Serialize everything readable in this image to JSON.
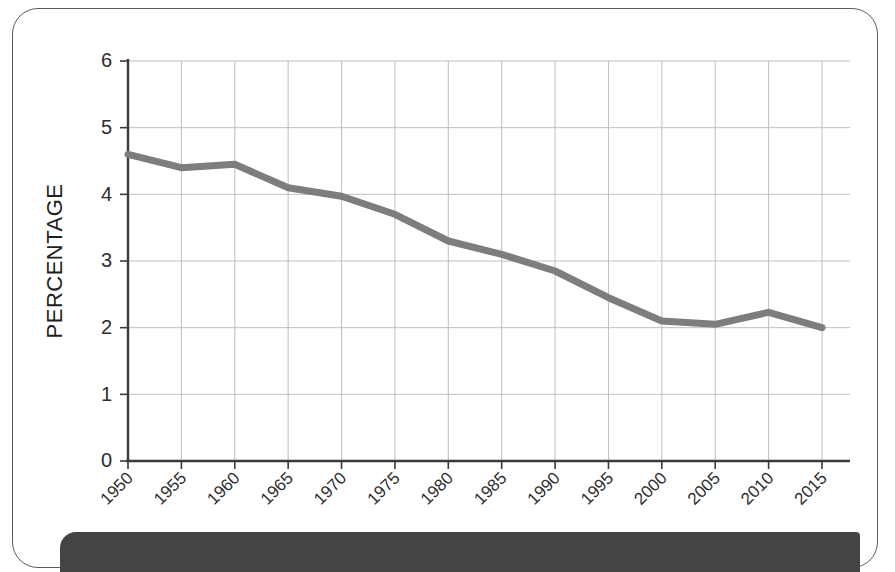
{
  "figure": {
    "card_border_color": "#5c5c5c",
    "bottom_band_color": "#444444",
    "background_color": "#ffffff"
  },
  "chart_data": {
    "type": "line",
    "title": "",
    "subtitle": "",
    "xlabel": "",
    "ylabel": "PERCENTAGE",
    "x": [
      1950,
      1955,
      1960,
      1965,
      1970,
      1975,
      1980,
      1985,
      1990,
      1995,
      2000,
      2005,
      2010,
      2015
    ],
    "values": [
      4.6,
      4.4,
      4.45,
      4.1,
      3.97,
      3.7,
      3.3,
      3.1,
      2.85,
      2.45,
      2.1,
      2.05,
      2.23,
      2.0
    ],
    "series": [
      {
        "name": "Percentage",
        "color": "#7d7d7d",
        "values": [
          4.6,
          4.4,
          4.45,
          4.1,
          3.97,
          3.7,
          3.3,
          3.1,
          2.85,
          2.45,
          2.1,
          2.05,
          2.23,
          2.0
        ]
      }
    ],
    "categories": [
      "1950",
      "1955",
      "1960",
      "1965",
      "1970",
      "1975",
      "1980",
      "1985",
      "1990",
      "1995",
      "2000",
      "2005",
      "2010",
      "2015"
    ],
    "xtick_labels": [
      "1950",
      "1955",
      "1960",
      "1965",
      "1970",
      "1975",
      "1980",
      "1985",
      "1990",
      "1995",
      "2000",
      "2005",
      "2010",
      "2015"
    ],
    "ytick_labels": [
      "0",
      "1",
      "2",
      "3",
      "4",
      "5",
      "6"
    ],
    "ytick_values": [
      0,
      1,
      2,
      3,
      4,
      5,
      6
    ],
    "ylim": [
      0,
      6
    ],
    "xlim": [
      1950,
      2015
    ],
    "grid": true,
    "grid_color": "#b9b9b9",
    "legend": false,
    "legend_position": "none",
    "line_color": "#7d7d7d",
    "axis_color": "#3a3a3a",
    "xtick_rotation": 45
  }
}
